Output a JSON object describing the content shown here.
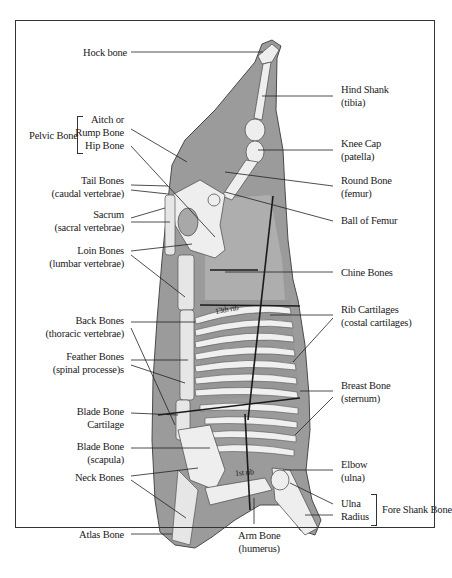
{
  "diagram": {
    "colors": {
      "background": "#ffffff",
      "frame": "#333333",
      "carcass_fill": "#9a9a9a",
      "carcass_light": "#bdbdbd",
      "bone_fill": "#eeeeee",
      "leader_line": "#222222",
      "text": "#1a1a1a"
    },
    "left_labels": [
      {
        "id": "hock-bone",
        "lines": [
          "Hock bone"
        ]
      },
      {
        "id": "aitch-rump-bone",
        "lines": [
          "Aitch or",
          "Rump Bone"
        ]
      },
      {
        "id": "hip-bone",
        "lines": [
          "Hip Bone"
        ]
      },
      {
        "id": "tail-bones",
        "lines": [
          "Tail Bones",
          "(caudal vertebrae)"
        ]
      },
      {
        "id": "sacrum",
        "lines": [
          "Sacrum",
          "(sacral vertebrae)"
        ]
      },
      {
        "id": "loin-bones",
        "lines": [
          "Loin Bones",
          "(lumbar vertebrae)"
        ]
      },
      {
        "id": "back-bones",
        "lines": [
          "Back Bones",
          "(thoracic vertebrae)"
        ]
      },
      {
        "id": "feather-bones",
        "lines": [
          "Feather Bones",
          "(spinal processe)s"
        ]
      },
      {
        "id": "blade-bone-cartilage",
        "lines": [
          "Blade Bone",
          "Cartilage"
        ]
      },
      {
        "id": "blade-bone",
        "lines": [
          "Blade Bone",
          "(scapula)"
        ]
      },
      {
        "id": "neck-bones",
        "lines": [
          "Neck Bones"
        ]
      },
      {
        "id": "atlas-bone",
        "lines": [
          "Atlas Bone"
        ]
      }
    ],
    "group_labels": {
      "pelvic_bone": "Pelvic Bone",
      "fore_shank_bone": "Fore Shank Bone"
    },
    "right_labels": [
      {
        "id": "hind-shank",
        "lines": [
          "Hind Shank",
          "(tibia)"
        ]
      },
      {
        "id": "knee-cap",
        "lines": [
          "Knee Cap",
          "(patella)"
        ]
      },
      {
        "id": "round-bone",
        "lines": [
          "Round Bone",
          "(femur)"
        ]
      },
      {
        "id": "ball-of-femur",
        "lines": [
          "Ball of Femur"
        ]
      },
      {
        "id": "chine-bones",
        "lines": [
          "Chine Bones"
        ]
      },
      {
        "id": "rib-cartilages",
        "lines": [
          "Rib Cartilages",
          "(costal cartilages)"
        ]
      },
      {
        "id": "breast-bone",
        "lines": [
          "Breast Bone",
          "(sternum)"
        ]
      },
      {
        "id": "elbow",
        "lines": [
          "Elbow",
          "(ulna)"
        ]
      },
      {
        "id": "ulna",
        "lines": [
          "Ulna"
        ]
      },
      {
        "id": "radius",
        "lines": [
          "Radius"
        ]
      }
    ],
    "bottom_labels": [
      {
        "id": "arm-bone",
        "lines": [
          "Arm Bone",
          "(humerus)"
        ]
      }
    ],
    "inline_annotations": {
      "rib_13": "13th rib",
      "rib_1": "1st rib"
    }
  }
}
